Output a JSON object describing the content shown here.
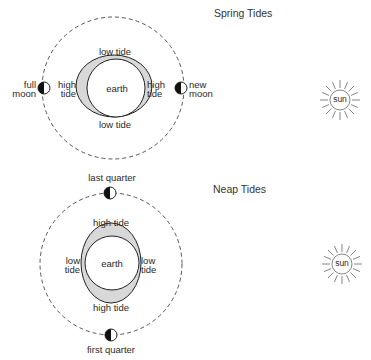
{
  "spring": {
    "title": "Spring Tides",
    "earth": "earth",
    "top_tide": "low tide",
    "bottom_tide": "low tide",
    "left_tide": [
      "high",
      "tide"
    ],
    "right_tide": [
      "high",
      "tide"
    ],
    "left_moon": [
      "full",
      "moon"
    ],
    "right_moon": [
      "new",
      "moon"
    ],
    "sun": "sun"
  },
  "neap": {
    "title": "Neap Tides",
    "earth": "earth",
    "top_tide": "high tide",
    "bottom_tide": "high tide",
    "left_tide": [
      "low",
      "tide"
    ],
    "right_tide": [
      "low",
      "tide"
    ],
    "top_moon": "last quarter",
    "bottom_moon": "first quarter",
    "sun": "sun"
  },
  "colors": {
    "line": "#222222",
    "tide_bulge": "#d8d8d8",
    "orbit": "#555555"
  }
}
